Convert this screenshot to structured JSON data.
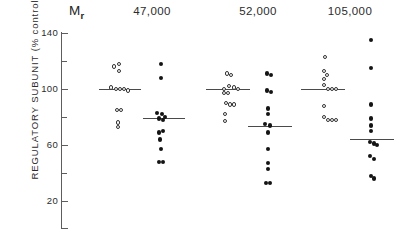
{
  "chart_data": {
    "type": "scatter",
    "title": "",
    "xlabel": "",
    "ylabel": "REGULATORY  SUBUNIT  (% control)",
    "mr_prefix": "M",
    "mr_subscript": "r",
    "ylim": [
      0,
      150
    ],
    "grid": false,
    "legend": "none",
    "yticks": [
      {
        "value": 140,
        "label": "140",
        "major": true
      },
      {
        "value": 120,
        "label": "",
        "major": false
      },
      {
        "value": 100,
        "label": "100",
        "major": true
      },
      {
        "value": 80,
        "label": "",
        "major": false
      },
      {
        "value": 60,
        "label": "60",
        "major": true
      },
      {
        "value": 40,
        "label": "",
        "major": false
      },
      {
        "value": 20,
        "label": "20",
        "major": true
      }
    ],
    "groups": [
      {
        "name": "group-47000",
        "label": "47,000",
        "center_px": 152,
        "series": [
          {
            "name": "control",
            "marker": "open-circle",
            "center_px": 117,
            "mean": 100,
            "mean_line": {
              "x1": 99,
              "x2": 141
            },
            "points": [
              {
                "value": 116,
                "dx": -3
              },
              {
                "value": 118,
                "dx": 2
              },
              {
                "value": 113,
                "dx": 2
              },
              {
                "value": 101,
                "dx": -6
              },
              {
                "value": 100,
                "dx": -1
              },
              {
                "value": 100,
                "dx": 3
              },
              {
                "value": 100,
                "dx": 7
              },
              {
                "value": 99,
                "dx": 11
              },
              {
                "value": 85,
                "dx": 0
              },
              {
                "value": 85,
                "dx": 4
              },
              {
                "value": 76,
                "dx": 1
              },
              {
                "value": 73,
                "dx": 1
              }
            ]
          },
          {
            "name": "treated",
            "marker": "closed-circle",
            "center_px": 161,
            "mean": 79,
            "mean_line": {
              "x1": 143,
              "x2": 185
            },
            "points": [
              {
                "value": 118,
                "dx": 0
              },
              {
                "value": 108,
                "dx": 0
              },
              {
                "value": 83,
                "dx": -4
              },
              {
                "value": 82,
                "dx": 1
              },
              {
                "value": 80,
                "dx": 4
              },
              {
                "value": 79,
                "dx": -2
              },
              {
                "value": 78,
                "dx": 2
              },
              {
                "value": 69,
                "dx": -2
              },
              {
                "value": 70,
                "dx": 2
              },
              {
                "value": 64,
                "dx": -1
              },
              {
                "value": 57,
                "dx": 0
              },
              {
                "value": 48,
                "dx": -2
              },
              {
                "value": 48,
                "dx": 2
              }
            ]
          }
        ]
      },
      {
        "name": "group-52000",
        "label": "52,000",
        "center_px": 258,
        "series": [
          {
            "name": "control",
            "marker": "open-circle",
            "center_px": 228,
            "mean": 100,
            "mean_line": {
              "x1": 206,
              "x2": 250
            },
            "points": [
              {
                "value": 111,
                "dx": -1
              },
              {
                "value": 110,
                "dx": 3
              },
              {
                "value": 102,
                "dx": 1
              },
              {
                "value": 101,
                "dx": 6
              },
              {
                "value": 100,
                "dx": -4
              },
              {
                "value": 100,
                "dx": 10
              },
              {
                "value": 97,
                "dx": -4
              },
              {
                "value": 97,
                "dx": 0
              },
              {
                "value": 90,
                "dx": -2
              },
              {
                "value": 89,
                "dx": 2
              },
              {
                "value": 89,
                "dx": 6
              },
              {
                "value": 82,
                "dx": -3
              },
              {
                "value": 77,
                "dx": -3
              }
            ]
          },
          {
            "name": "treated",
            "marker": "closed-circle",
            "center_px": 268,
            "mean": 73,
            "mean_line": {
              "x1": 248,
              "x2": 292
            },
            "points": [
              {
                "value": 111,
                "dx": -1
              },
              {
                "value": 110,
                "dx": 3
              },
              {
                "value": 99,
                "dx": -1
              },
              {
                "value": 98,
                "dx": 3
              },
              {
                "value": 86,
                "dx": 0
              },
              {
                "value": 82,
                "dx": 0
              },
              {
                "value": 75,
                "dx": -3
              },
              {
                "value": 74,
                "dx": 2
              },
              {
                "value": 69,
                "dx": 0
              },
              {
                "value": 57,
                "dx": 0
              },
              {
                "value": 47,
                "dx": 0
              },
              {
                "value": 43,
                "dx": 0
              },
              {
                "value": 33,
                "dx": -2
              },
              {
                "value": 33,
                "dx": 2
              }
            ]
          }
        ]
      },
      {
        "name": "group-105000",
        "label": "105,000",
        "center_px": 350,
        "series": [
          {
            "name": "control",
            "marker": "open-circle",
            "center_px": 325,
            "mean": 100,
            "mean_line": {
              "x1": 301,
              "x2": 345
            },
            "points": [
              {
                "value": 123,
                "dx": 0
              },
              {
                "value": 113,
                "dx": -1
              },
              {
                "value": 110,
                "dx": 2
              },
              {
                "value": 107,
                "dx": -1
              },
              {
                "value": 103,
                "dx": -1
              },
              {
                "value": 100,
                "dx": 3
              },
              {
                "value": 100,
                "dx": 7
              },
              {
                "value": 100,
                "dx": 11
              },
              {
                "value": 88,
                "dx": -1
              },
              {
                "value": 80,
                "dx": -1
              },
              {
                "value": 78,
                "dx": 3
              },
              {
                "value": 78,
                "dx": 7
              },
              {
                "value": 78,
                "dx": 11
              }
            ]
          },
          {
            "name": "treated",
            "marker": "closed-circle",
            "center_px": 371,
            "mean": 64,
            "mean_line": {
              "x1": 350,
              "x2": 394
            },
            "points": [
              {
                "value": 135,
                "dx": 0
              },
              {
                "value": 115,
                "dx": 0
              },
              {
                "value": 89,
                "dx": 0
              },
              {
                "value": 79,
                "dx": 0
              },
              {
                "value": 74,
                "dx": 0
              },
              {
                "value": 70,
                "dx": 0
              },
              {
                "value": 62,
                "dx": -1
              },
              {
                "value": 61,
                "dx": 3
              },
              {
                "value": 60,
                "dx": 6
              },
              {
                "value": 52,
                "dx": -1
              },
              {
                "value": 50,
                "dx": 3
              },
              {
                "value": 38,
                "dx": 0
              },
              {
                "value": 36,
                "dx": 3
              }
            ]
          }
        ]
      }
    ]
  }
}
